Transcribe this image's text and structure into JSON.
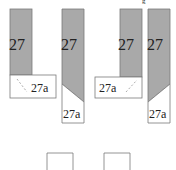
{
  "diagram": {
    "colors": {
      "gray": "#a9a9a9",
      "border": "#7a7a7a",
      "white": "#ffffff",
      "text": "#222222"
    },
    "top_fragment": "g",
    "strips": [
      {
        "id": "strip-1",
        "main_label": "27",
        "sub_label": "27a",
        "variant": "flap-left"
      },
      {
        "id": "strip-2",
        "main_label": "27",
        "sub_label": "27a",
        "variant": "angled-cut-left"
      },
      {
        "id": "strip-3",
        "main_label": "27",
        "sub_label": "27a",
        "variant": "flap-right"
      },
      {
        "id": "strip-4",
        "main_label": "27",
        "sub_label": "27a",
        "variant": "angled-cut-right"
      }
    ],
    "bottom_boxes": [
      {
        "id": "box-1"
      },
      {
        "id": "box-2"
      }
    ]
  }
}
